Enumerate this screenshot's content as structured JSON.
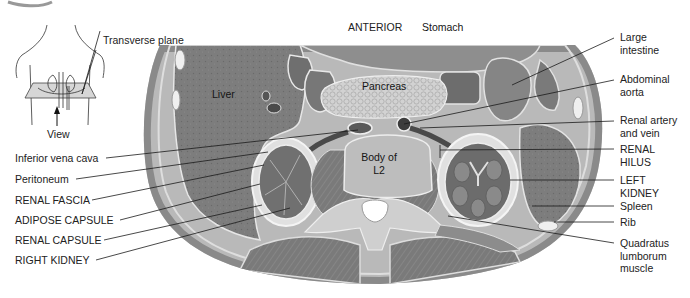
{
  "figure": {
    "orientation_label": "ANTERIOR",
    "inset": {
      "plane_label": "Transverse plane",
      "view_label": "View"
    },
    "organ_labels": {
      "liver": "Liver",
      "stomach": "Stomach",
      "pancreas": "Pancreas",
      "vertebra_line1": "Body of",
      "vertebra_line2": "L2"
    },
    "left_labels": [
      {
        "text": "Inferior vena cava"
      },
      {
        "text": "Peritoneum"
      },
      {
        "text": "RENAL FASCIA"
      },
      {
        "text": "ADIPOSE CAPSULE"
      },
      {
        "text": "RENAL CAPSULE"
      },
      {
        "text": "RIGHT KIDNEY"
      }
    ],
    "right_labels": [
      {
        "line1": "Large",
        "line2": "intestine"
      },
      {
        "line1": "Abdominal",
        "line2": "aorta"
      },
      {
        "line1": "Renal artery",
        "line2": "and vein"
      },
      {
        "line1": "RENAL",
        "line2": "HILUS"
      },
      {
        "line1": "LEFT",
        "line2": "KIDNEY"
      },
      {
        "line1": "Spleen"
      },
      {
        "line1": "Rib"
      },
      {
        "line1": "Quadratus",
        "line2": "lumborum",
        "line3": "muscle"
      }
    ],
    "colors": {
      "tissue_dark": "#6e6e6e",
      "tissue_mid": "#8f8f8f",
      "tissue_light": "#c4c4c4",
      "fascia": "#e2e2e2",
      "line": "#1a1a1a"
    }
  }
}
